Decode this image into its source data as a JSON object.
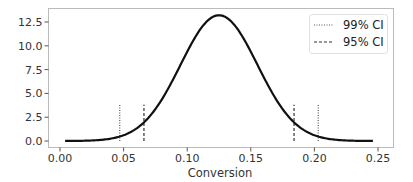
{
  "chart_data": {
    "type": "line",
    "title": "",
    "xlabel": "Conversion",
    "ylabel": "",
    "xlim": [
      -0.01,
      0.262
    ],
    "ylim": [
      -0.7,
      13.9
    ],
    "xticks": [
      0.0,
      0.05,
      0.1,
      0.15,
      0.2,
      0.25
    ],
    "xtick_labels": [
      "0.00",
      "0.05",
      "0.10",
      "0.15",
      "0.20",
      "0.25"
    ],
    "yticks": [
      0.0,
      2.5,
      5.0,
      7.5,
      10.0,
      12.5
    ],
    "ytick_labels": [
      "0.0",
      "2.5",
      "5.0",
      "7.5",
      "10.0",
      "12.5"
    ],
    "grid": false,
    "legend_position": "upper right",
    "series": [
      {
        "name": "posterior density",
        "style": "solid",
        "color": "#111111",
        "distribution": {
          "kind": "normal",
          "mean": 0.125,
          "sd": 0.0302
        },
        "x_range": [
          0.004,
          0.246
        ],
        "peak": {
          "x": 0.125,
          "y": 13.2
        }
      }
    ],
    "vlines": [
      {
        "name": "99% CI",
        "style": "dotted",
        "color": "#333333",
        "x": [
          0.047,
          0.203
        ],
        "y": [
          0,
          3.8
        ]
      },
      {
        "name": "95% CI",
        "style": "dashed",
        "color": "#333333",
        "x": [
          0.066,
          0.184
        ],
        "y": [
          0,
          3.8
        ]
      }
    ],
    "legend": [
      "99% CI",
      "95% CI"
    ]
  }
}
